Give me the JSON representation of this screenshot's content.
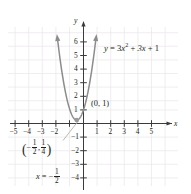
{
  "chart_data": {
    "type": "line",
    "title": "",
    "xlabel": "x",
    "ylabel": "y",
    "grid": true,
    "legend_position": "none",
    "xlim": [
      -6,
      6
    ],
    "ylim": [
      -4.8,
      7
    ],
    "xticks": [
      -5,
      -4,
      -3,
      -2,
      1,
      2,
      3,
      4,
      5
    ],
    "xtick_labels": [
      "−5",
      "−4",
      "−3",
      "−2",
      "1",
      "2",
      "3",
      "4",
      "5"
    ],
    "yticks": [
      6,
      5,
      4,
      3,
      2,
      1,
      -1,
      -2,
      -3,
      -4
    ],
    "ytick_labels": [
      "6",
      "5",
      "4",
      "3",
      "2",
      "1",
      "−1",
      "−2",
      "−3",
      "−4"
    ],
    "series": [
      {
        "name": "y = 3x^2 + 3x + 1",
        "type": "parabola",
        "a": 3,
        "b": 3,
        "c": 1,
        "vertex": [
          -0.5,
          0.25
        ],
        "y_intercept": [
          0,
          1
        ],
        "axis_of_symmetry": -0.5,
        "color": "#8c8c8c",
        "arrow_ends": true,
        "x": [
          -1.72,
          -1.5,
          -1.25,
          -1.0,
          -0.75,
          -0.5,
          -0.25,
          0,
          0.25,
          0.5,
          0.72
        ],
        "values": [
          4.72,
          3.25,
          1.94,
          1.0,
          0.44,
          0.25,
          0.44,
          1.0,
          1.94,
          3.25,
          4.72
        ]
      }
    ],
    "annotations": [
      {
        "name": "equation-label",
        "text": "y = 3x² + 3x + 1",
        "at": [
          1.3,
          5.6
        ]
      },
      {
        "name": "y-intercept-label",
        "text": "(0, 1)",
        "at": [
          0.35,
          1.0
        ]
      },
      {
        "name": "vertex-label",
        "text": "(−1/2, 1/4)",
        "at": [
          -3.3,
          -1.9
        ]
      },
      {
        "name": "axis-of-symmetry-label",
        "text": "x = −1/2",
        "at": [
          -2.6,
          -3.9
        ]
      }
    ]
  },
  "figure": {
    "equation": {
      "lhs": "y",
      "eq": "=",
      "term1_coef": "3",
      "term1_var": "x",
      "term1_exp": "2",
      "plus1": "+",
      "term2": "3x",
      "plus2": "+",
      "term3": "1"
    },
    "y_intercept_label": "(0, 1)",
    "vertex_label": {
      "open": "(",
      "minus": "−",
      "x_num": "1",
      "x_den": "2",
      "comma": ",",
      "y_num": "1",
      "y_den": "4",
      "close": ")"
    },
    "axis_symmetry": {
      "var": "x",
      "eq": "=",
      "minus": "−",
      "num": "1",
      "den": "2"
    },
    "x_axis_name": "x",
    "y_axis_name": "y",
    "x_labels": [
      "−5",
      "−4",
      "−3",
      "−2",
      "1",
      "2",
      "3",
      "4",
      "5"
    ],
    "y_labels": [
      "6",
      "5",
      "4",
      "3",
      "2",
      "1",
      "−1",
      "−2",
      "−3",
      "−4"
    ]
  },
  "colors": {
    "curve": "#8c8c8c",
    "axis": "#3b3b3b",
    "grid": "#e9e6e9",
    "text": "#231f20",
    "leader": "#a8a8a8"
  }
}
